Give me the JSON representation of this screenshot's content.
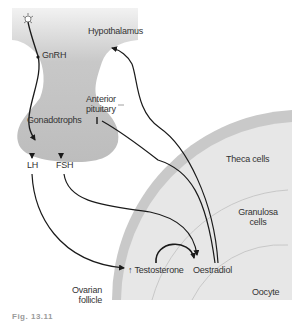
{
  "diagram": {
    "labels": {
      "hypothalamus": "Hypothalamus",
      "gnrh": "GnRH",
      "anterior_pituitary_1": "Anterior",
      "anterior_pituitary_2": "pituitary",
      "gonadotrophs": "Gonadotrophs",
      "lh": "LH",
      "fsh": "FSH",
      "theca_cells": "Theca cells",
      "granulosa_1": "Granulosa",
      "granulosa_2": "cells",
      "testosterone": "↑ Testosterone",
      "oestradiol": "Oestradiol",
      "oocyte": "Oocyte",
      "ovarian_1": "Ovarian",
      "ovarian_2": "follicle"
    },
    "caption": "Fig. 13.11",
    "colors": {
      "tissue_fill": "#c4c4c4",
      "follicle_outer": "#c8c8c8",
      "follicle_inner": "#e6e6e6",
      "arrow": "#1a1a1a",
      "text": "#333333"
    }
  }
}
